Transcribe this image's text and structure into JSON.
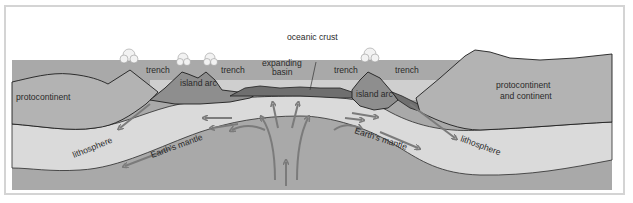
{
  "diagram": {
    "title": "",
    "colors": {
      "sky": "#ffffff",
      "continent": "#b3b3b3",
      "sea": "#cfcfcf",
      "island_arc": "#8e8e8e",
      "oceanic_crust": "#6f6f6f",
      "lithosphere": "#dadada",
      "mantle": "#a9a9a9",
      "arrows": "#7b7b7b",
      "outline": "#1e1e1e"
    },
    "labels": {
      "protocontinent_left": "protocontinent",
      "trench_1": "trench",
      "island_arc_left": "island arc",
      "trench_2": "trench",
      "expanding_basin_line1": "expanding",
      "expanding_basin_line2": "basin",
      "oceanic_crust": "oceanic crust",
      "trench_3": "trench",
      "island_arc_right": "island arc",
      "trench_4": "trench",
      "protocontinent_right_line1": "protocontinent",
      "protocontinent_right_line2": "and continent",
      "lithosphere_left": "lithosphere",
      "mantle_left": "Earth's mantle",
      "mantle_right": "Earth's mantle",
      "lithosphere_right": "lithosphere"
    },
    "features": [
      "volcano-left-continent",
      "volcano-island-arc-left-1",
      "volcano-island-arc-left-2",
      "volcano-island-arc-right",
      "mantle-convection-plume"
    ]
  }
}
